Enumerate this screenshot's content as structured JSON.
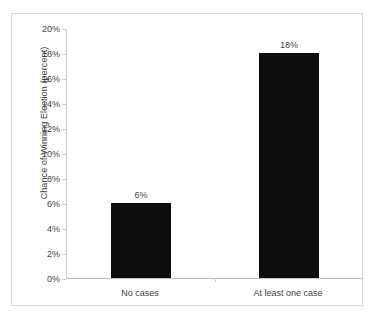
{
  "chart_data": {
    "type": "bar",
    "title": "",
    "xlabel": "",
    "ylabel": "Chance of Winning Election (percent)",
    "categories": [
      "No cases",
      "At least one case"
    ],
    "values": [
      6,
      18
    ],
    "value_labels": [
      "6%",
      "18%"
    ],
    "ylim": [
      0,
      20
    ],
    "ytick_values": [
      0,
      2,
      4,
      6,
      8,
      10,
      12,
      14,
      16,
      18,
      20
    ],
    "ytick_labels": [
      "0%",
      "2%",
      "4%",
      "6%",
      "8%",
      "10%",
      "12%",
      "14%",
      "16%",
      "18%",
      "20%"
    ],
    "grid": false,
    "legend": false,
    "bar_color": "#0d0d0d",
    "axis_color": "#d0d0d0",
    "text_color": "#3f3f3f",
    "frame_color": "#d9d9d9",
    "background": "#ffffff"
  }
}
